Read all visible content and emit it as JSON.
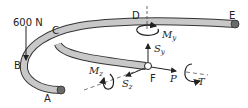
{
  "diagram": {
    "type": "bent-rod-free-body-diagram",
    "load": {
      "label": "600 N",
      "point": "B",
      "direction": "down"
    },
    "points": [
      {
        "id": "A",
        "label": "A"
      },
      {
        "id": "B",
        "label": "B"
      },
      {
        "id": "C",
        "label": "C"
      },
      {
        "id": "D",
        "label": "D"
      },
      {
        "id": "E",
        "label": "E"
      },
      {
        "id": "F",
        "label": "F"
      }
    ],
    "internal_forces": {
      "P": {
        "symbol": "P",
        "subscript": ""
      },
      "T": {
        "symbol": "T",
        "subscript": ""
      },
      "Sy": {
        "symbol": "S",
        "subscript": "y"
      },
      "Sz": {
        "symbol": "S",
        "subscript": "z"
      },
      "My": {
        "symbol": "M",
        "subscript": "y"
      },
      "Mz": {
        "symbol": "M",
        "subscript": "z"
      }
    },
    "colors": {
      "rod_fill": "#c8c8c8",
      "rod_outline": "#333333",
      "end_cap": "#6a6a6a",
      "line": "#222222"
    }
  }
}
